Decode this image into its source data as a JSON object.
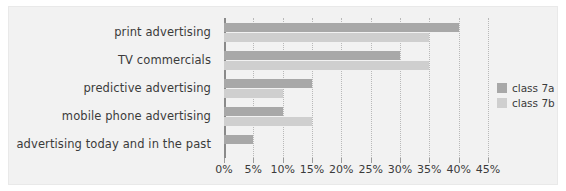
{
  "chart_data": {
    "type": "bar",
    "orientation": "horizontal",
    "title": "",
    "xlabel": "",
    "ylabel": "",
    "xlim": [
      0,
      45
    ],
    "grid": true,
    "legend_position": "right",
    "categories": [
      "print advertising",
      "TV commercials",
      "predictive advertising",
      "mobile phone advertising",
      "advertising today and in the past"
    ],
    "tick_labels": [
      "0%",
      "5%",
      "10%",
      "15%",
      "20%",
      "25%",
      "30%",
      "35%",
      "40%",
      "45%"
    ],
    "tick_values": [
      0,
      5,
      10,
      15,
      20,
      25,
      30,
      35,
      40,
      45
    ],
    "series": [
      {
        "name": "class 7a",
        "color": "#a8a8a8",
        "values": [
          40,
          30,
          15,
          10,
          5
        ]
      },
      {
        "name": "class 7b",
        "color": "#cfcfcf",
        "values": [
          35,
          35,
          10,
          15,
          0
        ]
      }
    ]
  },
  "legend": {
    "items": [
      {
        "label": "class 7a",
        "color": "#a8a8a8"
      },
      {
        "label": "class 7b",
        "color": "#cfcfcf"
      }
    ]
  },
  "colors": {
    "series_a": "#a8a8a8",
    "series_b": "#cfcfcf",
    "panel_background": "#f2f2f2",
    "axis": "#8a8a8a",
    "gridline": "#b9b9b9",
    "text": "#3b3b3b"
  }
}
